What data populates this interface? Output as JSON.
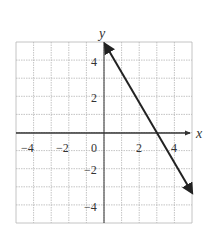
{
  "chart_data": {
    "type": "line",
    "title": "",
    "xlabel": "x",
    "ylabel": "y",
    "xlim": [
      -5,
      5
    ],
    "ylim": [
      -5,
      5
    ],
    "grid": true,
    "x_ticks": [
      -4,
      -2,
      0,
      2,
      4
    ],
    "y_ticks": [
      4,
      2,
      -2,
      -4
    ],
    "tick_labels": {
      "x": [
        "−4",
        "−2",
        "0",
        "2",
        "4"
      ],
      "y": [
        "4",
        "2",
        "−2",
        "−4"
      ]
    },
    "series": [
      {
        "name": "line",
        "equation": "y = -5/3 x + 5",
        "x": [
          0,
          3,
          5
        ],
        "y": [
          5,
          0,
          -3.33
        ],
        "arrows": "both ends"
      }
    ],
    "colors": {
      "line": "#222222",
      "grid": "#b5b5b5",
      "axis": "#333333"
    }
  }
}
